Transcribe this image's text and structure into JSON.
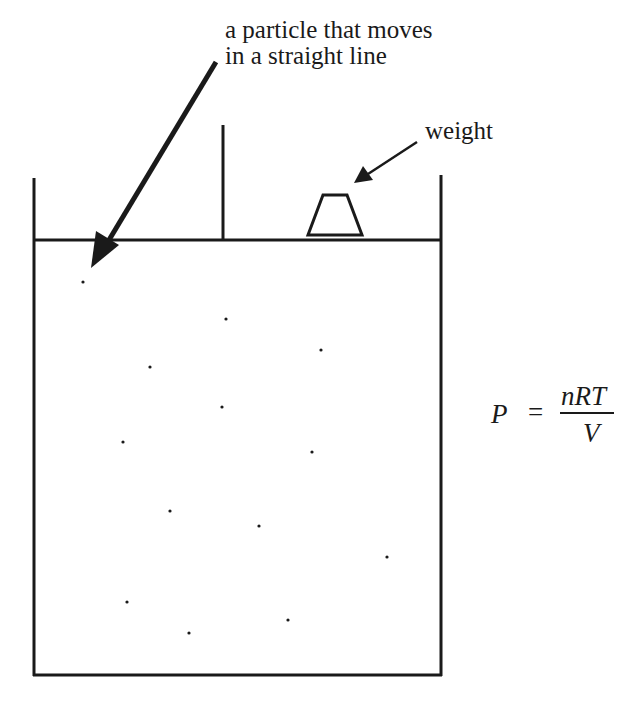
{
  "diagram": {
    "type": "gas-in-cylinder-with-piston",
    "annotations": {
      "particle": [
        "a particle that moves",
        "in a straight line"
      ],
      "weight": "weight"
    },
    "equation": {
      "lhs": "P",
      "operator": "=",
      "numerator": "nRT",
      "denominator": "V"
    },
    "particles": [
      [
        83,
        282
      ],
      [
        226,
        319
      ],
      [
        150,
        367
      ],
      [
        321,
        350
      ],
      [
        222,
        407
      ],
      [
        123,
        442
      ],
      [
        312,
        452
      ],
      [
        170,
        511
      ],
      [
        259,
        526
      ],
      [
        387,
        557
      ],
      [
        127,
        602
      ],
      [
        189,
        633
      ],
      [
        288,
        620
      ]
    ],
    "colors": {
      "ink": "#1a1a1a",
      "background": "#ffffff"
    }
  }
}
